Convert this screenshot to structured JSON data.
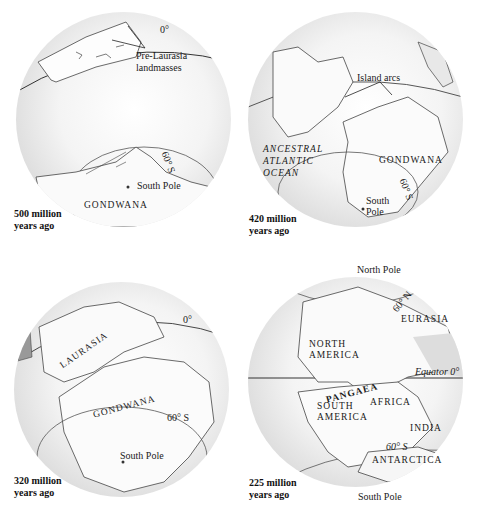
{
  "panels": [
    {
      "id": "500mya",
      "age_line1": "500 million",
      "age_line2": "years ago",
      "labels": {
        "equator": "0°",
        "pre_laurasia_1": "Pre-Laurasia",
        "pre_laurasia_2": "landmasses",
        "lat60": "60° S",
        "south_pole": "South Pole",
        "gondwana": "GONDWANA"
      }
    },
    {
      "id": "420mya",
      "age_line1": "420 million",
      "age_line2": "years ago",
      "labels": {
        "island_arcs": "Island arcs",
        "ocean_1": "ANCESTRAL",
        "ocean_2": "ATLANTIC",
        "ocean_3": "OCEAN",
        "gondwana": "GONDWANA",
        "lat60": "60° S",
        "south_pole_1": "South",
        "south_pole_2": "Pole"
      }
    },
    {
      "id": "320mya",
      "age_line1": "320 million",
      "age_line2": "years ago",
      "labels": {
        "equator": "0°",
        "laurasia": "LAURASIA",
        "gondwana": "GONDWANA",
        "lat60": "60° S",
        "south_pole": "South Pole"
      }
    },
    {
      "id": "225mya",
      "age_line1": "225 million",
      "age_line2": "years ago",
      "labels": {
        "north_pole": "North Pole",
        "lat60n": "60° N",
        "eurasia": "EURASIA",
        "north_america_1": "NORTH",
        "north_america_2": "AMERICA",
        "equator": "Equator 0°",
        "pangaea": "PANGAEA",
        "south_america_1": "SOUTH",
        "south_america_2": "AMERICA",
        "africa": "AFRICA",
        "india": "INDIA",
        "lat60s": "60° S",
        "antarctica": "ANTARCTICA",
        "south_pole": "South Pole"
      }
    }
  ]
}
